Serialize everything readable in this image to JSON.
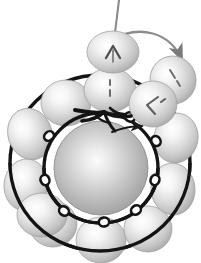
{
  "figure": {
    "title": "",
    "caption": "",
    "background_color": "#ffffff",
    "width": 201,
    "height": 263
  },
  "colors": {
    "background": "#ffffff",
    "ring_stroke": "#141414",
    "sphere_edge": "#9a9a9a",
    "sphere_highlight": "#ffffff",
    "sphere_midtone": "#c9c9c9",
    "core_highlight": "#f2f2f2",
    "core_edge": "#8a8a8a",
    "arrow_stroke": "#7a7a7a",
    "glyph_stroke": "#5a5a5a"
  },
  "central_body": {
    "name": "central-sphere",
    "label": "",
    "cx": 101,
    "cy": 168,
    "r": 47,
    "highlight_cx": 96,
    "highlight_cy": 163
  },
  "rings": [
    {
      "name": "inner-ring",
      "cx": 101,
      "cy": 168,
      "rx": 57,
      "ry": 55,
      "stroke_width": 3.4,
      "node_count": 8,
      "node_label": "loop-node"
    },
    {
      "name": "outer-ring",
      "cx": 100,
      "cy": 163,
      "rx": 90,
      "ry": 88,
      "stroke_width": 3.4,
      "node_count": 0,
      "node_label": ""
    }
  ],
  "inner_nodes": [
    {
      "angle": 205,
      "label": ""
    },
    {
      "angle": 245,
      "label": ""
    },
    {
      "angle": 287,
      "label": ""
    },
    {
      "angle": 330,
      "label": ""
    },
    {
      "angle": 18,
      "label": ""
    },
    {
      "angle": 62,
      "label": ""
    },
    {
      "angle": 104,
      "label": ""
    },
    {
      "angle": 148,
      "label": ""
    }
  ],
  "orbiting_spheres": [
    {
      "id": "s1",
      "ring": "outer",
      "cx": 30,
      "cy": 134,
      "rx": 22,
      "ry": 26,
      "rot": -18,
      "glyph": "",
      "label": ""
    },
    {
      "id": "s2",
      "ring": "outer",
      "cx": 26,
      "cy": 185,
      "rx": 22,
      "ry": 26,
      "rot": 6,
      "glyph": "",
      "label": ""
    },
    {
      "id": "s3",
      "ring": "outer",
      "cx": 53,
      "cy": 224,
      "rx": 24,
      "ry": 23,
      "rot": 0,
      "glyph": "",
      "label": ""
    },
    {
      "id": "s4",
      "ring": "outer",
      "cx": 101,
      "cy": 240,
      "rx": 25,
      "ry": 23,
      "rot": 0,
      "glyph": "",
      "label": ""
    },
    {
      "id": "s5",
      "ring": "outer",
      "cx": 148,
      "cy": 229,
      "rx": 24,
      "ry": 23,
      "rot": 0,
      "glyph": "",
      "label": ""
    },
    {
      "id": "s6",
      "ring": "outer",
      "cx": 173,
      "cy": 189,
      "rx": 22,
      "ry": 26,
      "rot": -6,
      "glyph": "",
      "label": ""
    },
    {
      "id": "s7",
      "ring": "outer",
      "cx": 176,
      "cy": 138,
      "rx": 22,
      "ry": 25,
      "rot": 10,
      "glyph": "",
      "label": ""
    },
    {
      "id": "s8",
      "ring": "outer",
      "cx": 173,
      "cy": 80,
      "rx": 23,
      "ry": 24,
      "rot": -12,
      "glyph": "dash-arrow",
      "label": ""
    },
    {
      "id": "s9",
      "ring": "inner",
      "cx": 63,
      "cy": 101,
      "rx": 25,
      "ry": 23,
      "rot": 0,
      "glyph": "",
      "label": ""
    },
    {
      "id": "s10",
      "ring": "inner",
      "cx": 110,
      "cy": 90,
      "rx": 26,
      "ry": 22,
      "rot": 0,
      "glyph": "dash-vertical",
      "label": ""
    },
    {
      "id": "s11",
      "ring": "inner",
      "cx": 153,
      "cy": 104,
      "rx": 24,
      "ry": 23,
      "rot": 0,
      "glyph": "angle-chevron",
      "label": ""
    },
    {
      "id": "s12",
      "ring": "inner",
      "cx": 42,
      "cy": 215,
      "rx": 25,
      "ry": 22,
      "rot": 0,
      "glyph": "",
      "label": ""
    }
  ],
  "ejected_sphere": {
    "id": "s0",
    "name": "ejected-sphere",
    "cx": 113,
    "cy": 52,
    "rx": 26,
    "ry": 21,
    "glyph": "up-chevron",
    "label": ""
  },
  "annotations": {
    "trajectory_line": {
      "name": "trajectory-line",
      "label": "",
      "from_x": 119,
      "from_y": 0,
      "to_x": 113,
      "to_y": 52
    },
    "motion_arrow": {
      "name": "motion-arrow",
      "label": "",
      "direction": "clockwise",
      "start_x": 112,
      "start_y": 44,
      "end_x": 180,
      "end_y": 66
    },
    "inner_arrow": {
      "name": "inner-recoil-arrow",
      "label": "",
      "direction": "right"
    }
  },
  "legend": {
    "items": []
  }
}
